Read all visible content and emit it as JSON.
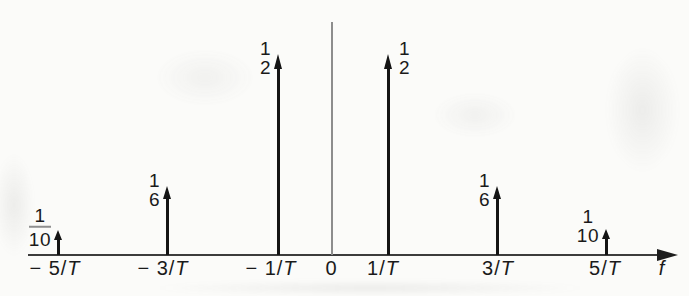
{
  "chart_data": {
    "type": "stem",
    "description_type": "impulse-frequency-spectrum",
    "title": "",
    "axis": {
      "xlabel": "f",
      "origin_label": "0",
      "x_tick_labels": [
        "− 5/T",
        "− 3/T",
        "− 1/T",
        "0",
        "1/T",
        "3/T",
        "5/T"
      ],
      "x_range_in_1_over_T": [
        -6,
        6
      ],
      "grid": "off"
    },
    "x_over_T": [
      -5,
      -3,
      -1,
      1,
      3,
      5
    ],
    "values": [
      0.1,
      0.1667,
      0.5,
      0.5,
      0.1667,
      0.1
    ],
    "impulses": [
      {
        "f_over_T": -5,
        "tick_prefix": "− 5/",
        "tick_italic": "T",
        "amplitude_label": "1/10",
        "value": 0.1,
        "numerator": "1",
        "denominator": "10",
        "has_fraction_bar": true,
        "amp_label_side": "left",
        "px": {
          "x": 58,
          "height": 25,
          "tick_cx": 55
        }
      },
      {
        "f_over_T": -3,
        "tick_prefix": "− 3/",
        "tick_italic": "T",
        "amplitude_label": "1/6",
        "value": 0.1667,
        "numerator": "1",
        "denominator": "6",
        "has_fraction_bar": false,
        "amp_label_side": "left",
        "px": {
          "x": 167,
          "height": 69,
          "tick_cx": 163
        }
      },
      {
        "f_over_T": -1,
        "tick_prefix": "− 1/",
        "tick_italic": "T",
        "amplitude_label": "1/2",
        "value": 0.5,
        "numerator": "1",
        "denominator": "2",
        "has_fraction_bar": false,
        "amp_label_side": "left",
        "px": {
          "x": 278,
          "height": 201,
          "tick_cx": 271
        }
      },
      {
        "f_over_T": 1,
        "tick_prefix": "1/",
        "tick_italic": "T",
        "amplitude_label": "1/2",
        "value": 0.5,
        "numerator": "1",
        "denominator": "2",
        "has_fraction_bar": false,
        "amp_label_side": "right",
        "px": {
          "x": 388,
          "height": 201,
          "tick_cx": 383
        }
      },
      {
        "f_over_T": 3,
        "tick_prefix": "3/",
        "tick_italic": "T",
        "amplitude_label": "1/6",
        "value": 0.1667,
        "numerator": "1",
        "denominator": "6",
        "has_fraction_bar": false,
        "amp_label_side": "left",
        "px": {
          "x": 497,
          "height": 69,
          "tick_cx": 498
        }
      },
      {
        "f_over_T": 5,
        "tick_prefix": "5/",
        "tick_italic": "T",
        "amplitude_label": "1/10",
        "value": 0.1,
        "numerator": "1",
        "denominator": "10",
        "has_fraction_bar": false,
        "amp_label_side": "left",
        "px": {
          "x": 606,
          "height": 26,
          "tick_cx": 605
        }
      }
    ],
    "layout_hints": {
      "baseline_y": 255,
      "x_axis_start": 28,
      "x_axis_tip": 678,
      "y_axis_x": 332,
      "y_axis_top": 22,
      "origin_label_cx": 331,
      "f_label_cx": 662,
      "legend": "none"
    },
    "colors": {
      "ink": "#141414",
      "axis_line": "#3c3c3c",
      "y_axis_gray": "#8d8d8d",
      "background": "#fbfbf9"
    }
  }
}
